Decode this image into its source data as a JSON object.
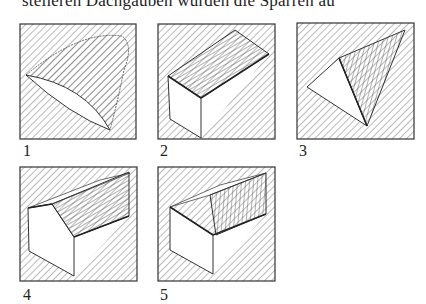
{
  "header": {
    "partial_text": "steileren Dachgauben würden die Sparren au"
  },
  "panels": [
    {
      "id": 1,
      "label": "1",
      "description": "curved dormer shape (eyebrow)"
    },
    {
      "id": 2,
      "label": "2",
      "description": "shed dormer box"
    },
    {
      "id": 3,
      "label": "3",
      "description": "triangular dormer"
    },
    {
      "id": 4,
      "label": "4",
      "description": "gable dormer with hatched roof"
    },
    {
      "id": 5,
      "label": "5",
      "description": "gable dormer with vertical-hatched roof"
    }
  ],
  "colors": {
    "line": "#333333",
    "hatch": "#555555",
    "background": "#ffffff"
  }
}
